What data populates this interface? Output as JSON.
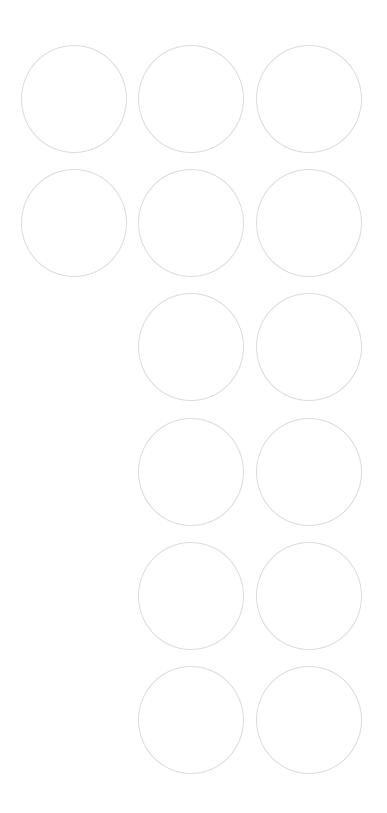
{
  "screen": {
    "background_color": "#ffffff",
    "circle_stroke_color": "#dcdcdc"
  },
  "grid": {
    "rows": [
      {
        "cells": [
          {
            "label": ""
          },
          {
            "label": ""
          },
          {
            "label": ""
          }
        ]
      },
      {
        "cells": [
          {
            "label": ""
          },
          {
            "label": ""
          },
          {
            "label": ""
          }
        ]
      },
      {
        "cells": [
          {
            "label": ""
          },
          {
            "label": ""
          }
        ]
      },
      {
        "cells": [
          {
            "label": ""
          },
          {
            "label": ""
          }
        ]
      },
      {
        "cells": [
          {
            "label": ""
          },
          {
            "label": ""
          }
        ]
      },
      {
        "cells": [
          {
            "label": ""
          },
          {
            "label": ""
          }
        ]
      }
    ]
  }
}
